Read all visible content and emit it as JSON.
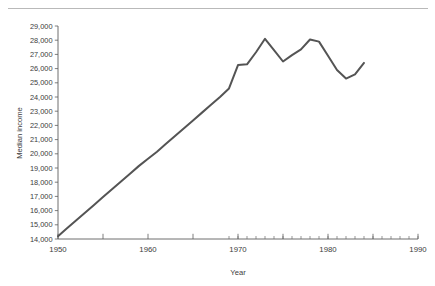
{
  "chart_data": {
    "type": "line",
    "title": "",
    "xlabel": "Year",
    "ylabel": "Median income",
    "xlim": [
      1950,
      1990
    ],
    "ylim": [
      14000,
      29000
    ],
    "grid": false,
    "legend": null,
    "x_ticks": [
      1950,
      1955,
      1960,
      1965,
      1970,
      1975,
      1980,
      1985,
      1990
    ],
    "x_tick_labels": [
      "1950",
      "",
      "1960",
      "",
      "1970",
      "",
      "1980",
      "",
      "1990"
    ],
    "x_minor_ticks": [
      1969,
      1970,
      1971,
      1972,
      1973,
      1974,
      1975,
      1976,
      1977,
      1978,
      1979,
      1980,
      1981,
      1982,
      1983,
      1984,
      1985,
      1986,
      1987,
      1988,
      1989,
      1990
    ],
    "y_ticks": [
      14000,
      15000,
      16000,
      17000,
      18000,
      19000,
      20000,
      21000,
      22000,
      23000,
      24000,
      25000,
      26000,
      27000,
      28000,
      29000
    ],
    "y_tick_labels": [
      "14,000",
      "15,000",
      "16,000",
      "17,000",
      "18,000",
      "19,000",
      "20,000",
      "21,000",
      "22,000",
      "23,000",
      "24,000",
      "25,000",
      "26,000",
      "27,000",
      "28,000",
      "29,000"
    ],
    "line_color": "#545454",
    "series": [
      {
        "name": "Median income",
        "x": [
          1950,
          1951,
          1952,
          1953,
          1954,
          1955,
          1956,
          1957,
          1958,
          1959,
          1960,
          1961,
          1962,
          1963,
          1964,
          1965,
          1966,
          1967,
          1968,
          1969,
          1970,
          1971,
          1972,
          1973,
          1974,
          1975,
          1976,
          1977,
          1978,
          1979,
          1980,
          1981,
          1982,
          1983,
          1984
        ],
        "values": [
          14200,
          14750,
          15300,
          15850,
          16400,
          16950,
          17500,
          18050,
          18600,
          19150,
          19650,
          20150,
          20700,
          21250,
          21800,
          22350,
          22900,
          23450,
          24000,
          24600,
          26250,
          26300,
          27150,
          28100,
          27300,
          26500,
          26950,
          27350,
          28050,
          27900,
          26900,
          25900,
          25300,
          25600,
          26400
        ]
      }
    ]
  },
  "axis_titles": {
    "x": "Year",
    "y": "Median income"
  }
}
